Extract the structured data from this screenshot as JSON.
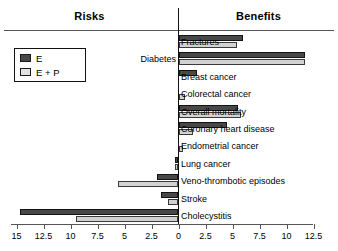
{
  "header": {
    "left_title": "Risks",
    "right_title": "Benefits"
  },
  "legend": {
    "items": [
      {
        "key": "E",
        "label": "E",
        "color": "#484848"
      },
      {
        "key": "E_P",
        "label": "E + P",
        "color": "#e2e2e2"
      }
    ]
  },
  "axis": {
    "tick_labels": [
      "15",
      "12.5",
      "10",
      "7.5",
      "5",
      "2.5",
      "0",
      "2.5",
      "5",
      "7.5",
      "10",
      "12.5"
    ],
    "tick_values": [
      -15,
      -12.5,
      -10,
      -7.5,
      -5,
      -2.5,
      0,
      2.5,
      5,
      7.5,
      10,
      12.5
    ],
    "zero_value": 0,
    "min": -15,
    "max": 12.5
  },
  "chart_data": {
    "type": "bar",
    "orientation": "horizontal",
    "title": "",
    "subtitle": "",
    "xlabel": "",
    "ylabel": "",
    "xlim": [
      -15,
      12.5
    ],
    "grid": false,
    "legend_position": "upper-left",
    "note": "Negative values are plotted to the left of zero (Risks); positive values to the right (Benefits).",
    "categories": [
      "Fractures",
      "Diabetes",
      "Breast cancer",
      "Colorectal cancer",
      "Overall mortality",
      "Coronary heart disease",
      "Endometrial cancer",
      "Lung cancer",
      "Veno-thrombotic episodes",
      "Stroke",
      "Cholecystitis"
    ],
    "label_side": [
      "right",
      "left",
      "right",
      "right",
      "right",
      "right",
      "right",
      "right",
      "right",
      "right",
      "right"
    ],
    "series": [
      {
        "name": "E",
        "color": "#484848",
        "values": [
          6.0,
          11.7,
          1.7,
          0.0,
          5.5,
          4.5,
          0.0,
          -0.3,
          -2.0,
          -1.6,
          -14.7
        ]
      },
      {
        "name": "E + P",
        "color": "#e2e2e2",
        "values": [
          5.4,
          11.7,
          0.0,
          0.6,
          5.8,
          1.3,
          0.4,
          -0.3,
          -5.6,
          -1.0,
          -9.5
        ]
      }
    ]
  }
}
